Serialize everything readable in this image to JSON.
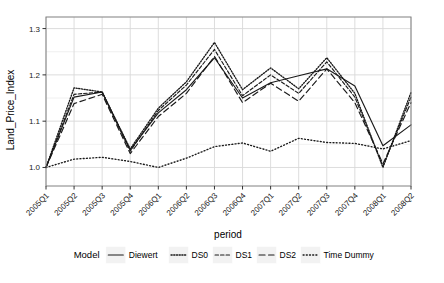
{
  "chart_data": {
    "type": "line",
    "title": "",
    "xlabel": "period",
    "ylabel": "Land_Price_Index",
    "legend_title": "Model",
    "legend_position": "bottom",
    "grid": true,
    "ylim": [
      0.96,
      1.325
    ],
    "yticks": [
      1.0,
      1.1,
      1.2,
      1.3
    ],
    "ytick_labels": [
      "1.0",
      "1.1",
      "1.2",
      "1.3"
    ],
    "yminor": [
      1.05,
      1.15,
      1.25
    ],
    "categories": [
      "2005Q1",
      "2005Q2",
      "2005Q3",
      "2005Q4",
      "2006Q1",
      "2006Q2",
      "2006Q3",
      "2006Q4",
      "2007Q1",
      "2007Q2",
      "2007Q3",
      "2007Q4",
      "2008Q1",
      "2008Q2"
    ],
    "series": [
      {
        "name": "Diewert",
        "style": "solid",
        "color": "#1a1a1a",
        "values": [
          1.0,
          1.152,
          1.163,
          1.038,
          1.118,
          1.168,
          1.237,
          1.15,
          1.183,
          1.198,
          1.213,
          1.176,
          1.047,
          1.092
        ]
      },
      {
        "name": "DS0",
        "style": "dotted-fine",
        "color": "#1a1a1a",
        "values": [
          1.0,
          1.172,
          1.163,
          1.04,
          1.128,
          1.185,
          1.27,
          1.168,
          1.215,
          1.17,
          1.237,
          1.16,
          1.0,
          1.162
        ]
      },
      {
        "name": "DS1",
        "style": "dashed-short",
        "color": "#1a1a1a",
        "values": [
          1.0,
          1.158,
          1.163,
          1.035,
          1.123,
          1.178,
          1.255,
          1.155,
          1.2,
          1.16,
          1.228,
          1.152,
          1.003,
          1.152
        ]
      },
      {
        "name": "DS2",
        "style": "dashed-long",
        "color": "#1a1a1a",
        "values": [
          1.0,
          1.138,
          1.158,
          1.03,
          1.11,
          1.16,
          1.24,
          1.14,
          1.182,
          1.143,
          1.213,
          1.14,
          1.008,
          1.14
        ]
      },
      {
        "name": "Time Dummy",
        "style": "dotted",
        "color": "#1a1a1a",
        "values": [
          1.0,
          1.018,
          1.022,
          1.013,
          1.0,
          1.02,
          1.045,
          1.053,
          1.035,
          1.063,
          1.054,
          1.052,
          1.04,
          1.058
        ]
      }
    ]
  },
  "axes": {
    "ylabel": "Land_Price_Index",
    "xlabel": "period"
  },
  "legend": {
    "title": "Model",
    "entries": [
      {
        "label": "Diewert",
        "style": "solid"
      },
      {
        "label": "DS0",
        "style": "dotted-fine"
      },
      {
        "label": "DS1",
        "style": "dashed-short"
      },
      {
        "label": "DS2",
        "style": "dashed-long"
      },
      {
        "label": "Time Dummy",
        "style": "dotted"
      }
    ]
  },
  "colors": {
    "line": "#1a1a1a",
    "grid_major": "#d9d9d9",
    "grid_minor": "#ececec",
    "panel_border": "#808080",
    "background": "#ffffff"
  }
}
